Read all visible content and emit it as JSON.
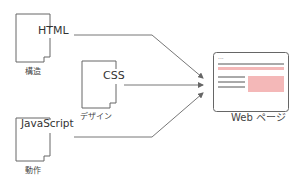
{
  "diagram": {
    "documents": [
      {
        "id": "html",
        "name": "HTML",
        "caption": "構造"
      },
      {
        "id": "css",
        "name": "CSS",
        "caption": "デザイン"
      },
      {
        "id": "js",
        "name": "JavaScript",
        "caption": "動作"
      }
    ],
    "target": {
      "caption": "Web ページ",
      "dots": "..."
    },
    "colors": {
      "stroke": "#666666",
      "accent_pink": "#f4b8b8",
      "text": "#333333"
    }
  }
}
